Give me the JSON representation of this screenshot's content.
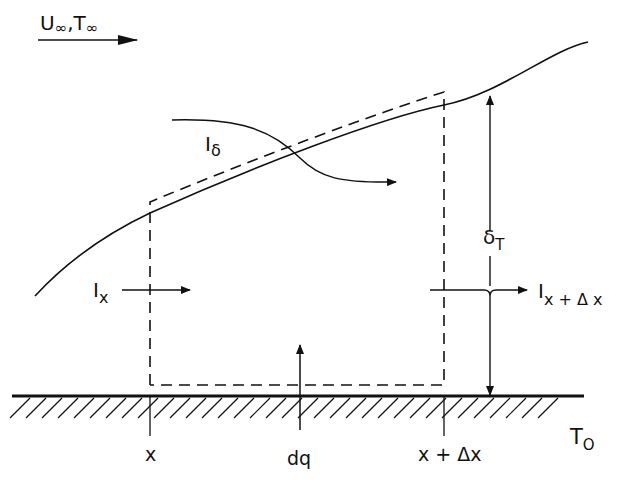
{
  "diagram": {
    "freestream": {
      "label_u": "U",
      "label_t": "T",
      "subscript": "∞",
      "separator": ","
    },
    "labels": {
      "I_delta": {
        "main": "I",
        "sub": "δ"
      },
      "I_x": {
        "main": "I",
        "sub": "x"
      },
      "I_x_dx": {
        "main": "I",
        "sub": "x + Δ x"
      },
      "delta_T": {
        "main": "δ",
        "sub": "T"
      },
      "T_0": {
        "main": "T",
        "sub": "O"
      },
      "x": "x",
      "dq": "dq",
      "x_dx": "x + Δx"
    },
    "colors": {
      "ink": "#111111",
      "background": "#ffffff"
    }
  }
}
